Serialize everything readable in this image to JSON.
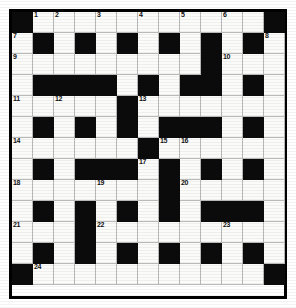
{
  "puzzle": {
    "kind": "crossword-grid",
    "title": "Crossword Puzzle Grid",
    "rows": 13,
    "cols": 13,
    "cell_size_px": 21,
    "colors": {
      "block": "#0b0b0b",
      "empty": "#fbfbf9",
      "gridline": "#b9b9b9",
      "border": "#000000",
      "number": "#111111",
      "page": "#ffffff"
    },
    "legend": {
      "block_char": "#",
      "empty_char": "."
    },
    "layout_rows": [
      "#...........#",
      ".#.#.#.#.#.#.",
      ".........#...",
      ".####.#.##.#.",
      ".....#.......",
      ".#.#.#.###.#.",
      "......#......",
      ".#.###.#.#.#.",
      ".......#.....",
      ".#.#.#.#.###.",
      "...#.........",
      ".#.#.#.#.#.#.",
      "#...........#"
    ],
    "numbers": [
      {
        "n": 1,
        "row": 1,
        "col": 2
      },
      {
        "n": 2,
        "row": 1,
        "col": 3
      },
      {
        "n": 3,
        "row": 1,
        "col": 5
      },
      {
        "n": 4,
        "row": 1,
        "col": 7
      },
      {
        "n": 5,
        "row": 1,
        "col": 9
      },
      {
        "n": 6,
        "row": 1,
        "col": 11
      },
      {
        "n": 7,
        "row": 2,
        "col": 1
      },
      {
        "n": 8,
        "row": 2,
        "col": 13
      },
      {
        "n": 9,
        "row": 3,
        "col": 1
      },
      {
        "n": 10,
        "row": 3,
        "col": 11
      },
      {
        "n": 11,
        "row": 5,
        "col": 1
      },
      {
        "n": 12,
        "row": 5,
        "col": 3
      },
      {
        "n": 13,
        "row": 5,
        "col": 7
      },
      {
        "n": 14,
        "row": 7,
        "col": 1
      },
      {
        "n": 15,
        "row": 7,
        "col": 8
      },
      {
        "n": 16,
        "row": 7,
        "col": 9
      },
      {
        "n": 17,
        "row": 8,
        "col": 7
      },
      {
        "n": 18,
        "row": 9,
        "col": 1
      },
      {
        "n": 19,
        "row": 9,
        "col": 5
      },
      {
        "n": 20,
        "row": 9,
        "col": 9
      },
      {
        "n": 21,
        "row": 11,
        "col": 1
      },
      {
        "n": 22,
        "row": 11,
        "col": 5
      },
      {
        "n": 23,
        "row": 11,
        "col": 11
      },
      {
        "n": 24,
        "row": 13,
        "col": 2
      }
    ],
    "entries": []
  }
}
